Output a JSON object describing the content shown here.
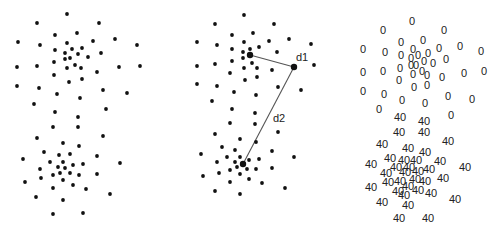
{
  "panels": [
    {
      "id": "raw-points",
      "points": [
        [
          67,
          14
        ],
        [
          37,
          23
        ],
        [
          99,
          23
        ],
        [
          55,
          35
        ],
        [
          77,
          33
        ],
        [
          18,
          42
        ],
        [
          40,
          45
        ],
        [
          67,
          43
        ],
        [
          93,
          41
        ],
        [
          115,
          39
        ],
        [
          137,
          45
        ],
        [
          55,
          50
        ],
        [
          65,
          53
        ],
        [
          72,
          49
        ],
        [
          82,
          48
        ],
        [
          78,
          54
        ],
        [
          70,
          58
        ],
        [
          65,
          59
        ],
        [
          88,
          57
        ],
        [
          101,
          53
        ],
        [
          54,
          62
        ],
        [
          75,
          65
        ],
        [
          17,
          67
        ],
        [
          37,
          66
        ],
        [
          67,
          68
        ],
        [
          81,
          68
        ],
        [
          97,
          72
        ],
        [
          119,
          67
        ],
        [
          140,
          66
        ],
        [
          54,
          75
        ],
        [
          82,
          79
        ],
        [
          69,
          82
        ],
        [
          17,
          86
        ],
        [
          39,
          88
        ],
        [
          57,
          94
        ],
        [
          80,
          98
        ],
        [
          103,
          90
        ],
        [
          127,
          93
        ],
        [
          34,
          104
        ],
        [
          55,
          112
        ],
        [
          106,
          109
        ],
        [
          78,
          117
        ],
        [
          53,
          127
        ],
        [
          78,
          127
        ],
        [
          37,
          138
        ],
        [
          103,
          136
        ],
        [
          63,
          143
        ],
        [
          79,
          146
        ],
        [
          44,
          152
        ],
        [
          59,
          155
        ],
        [
          70,
          154
        ],
        [
          23,
          159
        ],
        [
          97,
          156
        ],
        [
          50,
          162
        ],
        [
          63,
          162
        ],
        [
          73,
          165
        ],
        [
          83,
          164
        ],
        [
          120,
          163
        ],
        [
          58,
          167
        ],
        [
          65,
          168
        ],
        [
          40,
          169
        ],
        [
          60,
          173
        ],
        [
          70,
          173
        ],
        [
          53,
          175
        ],
        [
          79,
          175
        ],
        [
          97,
          174
        ],
        [
          63,
          180
        ],
        [
          41,
          178
        ],
        [
          25,
          182
        ],
        [
          73,
          185
        ],
        [
          53,
          188
        ],
        [
          86,
          189
        ],
        [
          110,
          194
        ],
        [
          36,
          197
        ],
        [
          63,
          200
        ],
        [
          53,
          214
        ],
        [
          83,
          213
        ]
      ]
    },
    {
      "id": "distance-illustration",
      "points": [
        [
          244,
          15
        ],
        [
          215,
          24
        ],
        [
          274,
          24
        ],
        [
          232,
          35
        ],
        [
          253,
          33
        ],
        [
          197,
          42
        ],
        [
          217,
          45
        ],
        [
          244,
          42
        ],
        [
          269,
          41
        ],
        [
          289,
          39
        ],
        [
          311,
          44
        ],
        [
          232,
          49
        ],
        [
          243,
          52
        ],
        [
          250,
          49
        ],
        [
          259,
          47
        ],
        [
          277,
          52
        ],
        [
          243,
          58
        ],
        [
          232,
          61
        ],
        [
          252,
          63
        ],
        [
          215,
          64
        ],
        [
          197,
          66
        ],
        [
          244,
          68
        ],
        [
          257,
          68
        ],
        [
          272,
          70
        ],
        [
          314,
          65
        ],
        [
          230,
          73
        ],
        [
          257,
          77
        ],
        [
          245,
          80
        ],
        [
          197,
          84
        ],
        [
          217,
          86
        ],
        [
          278,
          87
        ],
        [
          301,
          90
        ],
        [
          234,
          92
        ],
        [
          256,
          95
        ],
        [
          212,
          101
        ],
        [
          232,
          109
        ],
        [
          255,
          113
        ],
        [
          230,
          123
        ],
        [
          255,
          124
        ],
        [
          215,
          134
        ],
        [
          278,
          132
        ],
        [
          240,
          139
        ],
        [
          256,
          142
        ],
        [
          222,
          147
        ],
        [
          235,
          150
        ],
        [
          201,
          154
        ],
        [
          272,
          151
        ],
        [
          294,
          157
        ],
        [
          227,
          157
        ],
        [
          240,
          157
        ],
        [
          217,
          162
        ],
        [
          235,
          162
        ],
        [
          249,
          160
        ],
        [
          259,
          159
        ],
        [
          237,
          167
        ],
        [
          247,
          169
        ],
        [
          256,
          169
        ],
        [
          230,
          170
        ],
        [
          272,
          168
        ],
        [
          219,
          173
        ],
        [
          240,
          174
        ],
        [
          203,
          176
        ],
        [
          230,
          182
        ],
        [
          249,
          179
        ],
        [
          262,
          183
        ],
        [
          285,
          188
        ],
        [
          215,
          191
        ],
        [
          240,
          194
        ]
      ],
      "highlighted": {
        "center_top": [
          250,
          55
        ],
        "query_point": [
          294,
          67
        ],
        "center_bottom": [
          243,
          164
        ]
      },
      "edges": [
        {
          "from": [
            250,
            55
          ],
          "to": [
            294,
            67
          ],
          "label": "d1",
          "label_pos": [
            302,
            61
          ]
        },
        {
          "from": [
            294,
            67
          ],
          "to": [
            243,
            164
          ],
          "label": "d2",
          "label_pos": [
            279,
            122
          ]
        }
      ]
    },
    {
      "id": "cluster-labels",
      "labels": [
        {
          "text": "0",
          "pos": [
            412,
            21
          ]
        },
        {
          "text": "0",
          "pos": [
            383,
            30
          ]
        },
        {
          "text": "0",
          "pos": [
            444,
            30
          ]
        },
        {
          "text": "0",
          "pos": [
            401,
            42
          ]
        },
        {
          "text": "0",
          "pos": [
            423,
            40
          ]
        },
        {
          "text": "0",
          "pos": [
            363,
            49
          ]
        },
        {
          "text": "0",
          "pos": [
            385,
            52
          ]
        },
        {
          "text": "0",
          "pos": [
            413,
            49
          ]
        },
        {
          "text": "0",
          "pos": [
            439,
            48
          ]
        },
        {
          "text": "0",
          "pos": [
            460,
            46
          ]
        },
        {
          "text": "0",
          "pos": [
            481,
            51
          ]
        },
        {
          "text": "0",
          "pos": [
            401,
            55
          ]
        },
        {
          "text": "0",
          "pos": [
            411,
            58
          ]
        },
        {
          "text": "0",
          "pos": [
            418,
            55
          ]
        },
        {
          "text": "0",
          "pos": [
            428,
            53
          ]
        },
        {
          "text": "0",
          "pos": [
            446,
            59
          ]
        },
        {
          "text": "0",
          "pos": [
            424,
            61
          ]
        },
        {
          "text": "0",
          "pos": [
            433,
            63
          ]
        },
        {
          "text": "0",
          "pos": [
            411,
            65
          ]
        },
        {
          "text": "0",
          "pos": [
            416,
            65
          ]
        },
        {
          "text": "0",
          "pos": [
            400,
            68
          ]
        },
        {
          "text": "0",
          "pos": [
            363,
            72
          ]
        },
        {
          "text": "0",
          "pos": [
            383,
            71
          ]
        },
        {
          "text": "0",
          "pos": [
            413,
            74
          ]
        },
        {
          "text": "0",
          "pos": [
            422,
            71
          ]
        },
        {
          "text": "0",
          "pos": [
            427,
            75
          ]
        },
        {
          "text": "0",
          "pos": [
            442,
            77
          ]
        },
        {
          "text": "0",
          "pos": [
            464,
            73
          ]
        },
        {
          "text": "0",
          "pos": [
            484,
            71
          ]
        },
        {
          "text": "0",
          "pos": [
            399,
            80
          ]
        },
        {
          "text": "0",
          "pos": [
            414,
            87
          ]
        },
        {
          "text": "0",
          "pos": [
            427,
            85
          ]
        },
        {
          "text": "0",
          "pos": [
            363,
            91
          ]
        },
        {
          "text": "0",
          "pos": [
            384,
            94
          ]
        },
        {
          "text": "0",
          "pos": [
            402,
            100
          ]
        },
        {
          "text": "0",
          "pos": [
            425,
            103
          ]
        },
        {
          "text": "0",
          "pos": [
            448,
            96
          ]
        },
        {
          "text": "0",
          "pos": [
            472,
            99
          ]
        },
        {
          "text": "0",
          "pos": [
            379,
            109
          ]
        },
        {
          "text": "0",
          "pos": [
            451,
            115
          ]
        },
        {
          "text": "40",
          "pos": [
            400,
            117
          ]
        },
        {
          "text": "40",
          "pos": [
            424,
            121
          ]
        },
        {
          "text": "40",
          "pos": [
            399,
            132
          ]
        },
        {
          "text": "40",
          "pos": [
            424,
            132
          ]
        },
        {
          "text": "40",
          "pos": [
            382,
            144
          ]
        },
        {
          "text": "40",
          "pos": [
            448,
            141
          ]
        },
        {
          "text": "40",
          "pos": [
            408,
            148
          ]
        },
        {
          "text": "40",
          "pos": [
            425,
            152
          ]
        },
        {
          "text": "40",
          "pos": [
            390,
            158
          ]
        },
        {
          "text": "40",
          "pos": [
            404,
            160
          ]
        },
        {
          "text": "40",
          "pos": [
            416,
            160
          ]
        },
        {
          "text": "40",
          "pos": [
            440,
            161
          ]
        },
        {
          "text": "40",
          "pos": [
            371,
            164
          ]
        },
        {
          "text": "40",
          "pos": [
            396,
            167
          ]
        },
        {
          "text": "40",
          "pos": [
            409,
            167
          ]
        },
        {
          "text": "40",
          "pos": [
            418,
            171
          ]
        },
        {
          "text": "40",
          "pos": [
            429,
            169
          ]
        },
        {
          "text": "40",
          "pos": [
            465,
            167
          ]
        },
        {
          "text": "40",
          "pos": [
            386,
            173
          ]
        },
        {
          "text": "40",
          "pos": [
            405,
            172
          ]
        },
        {
          "text": "40",
          "pos": [
            388,
            182
          ]
        },
        {
          "text": "40",
          "pos": [
            400,
            181
          ]
        },
        {
          "text": "40",
          "pos": [
            415,
            179
          ]
        },
        {
          "text": "40",
          "pos": [
            425,
            181
          ]
        },
        {
          "text": "40",
          "pos": [
            443,
            178
          ]
        },
        {
          "text": "40",
          "pos": [
            371,
            187
          ]
        },
        {
          "text": "40",
          "pos": [
            408,
            186
          ]
        },
        {
          "text": "40",
          "pos": [
            418,
            190
          ]
        },
        {
          "text": "40",
          "pos": [
            398,
            191
          ]
        },
        {
          "text": "40",
          "pos": [
            404,
            195
          ]
        },
        {
          "text": "40",
          "pos": [
            431,
            193
          ]
        },
        {
          "text": "40",
          "pos": [
            382,
            202
          ]
        },
        {
          "text": "40",
          "pos": [
            408,
            205
          ]
        },
        {
          "text": "40",
          "pos": [
            455,
            199
          ]
        },
        {
          "text": "40",
          "pos": [
            399,
            218
          ]
        },
        {
          "text": "40",
          "pos": [
            428,
            218
          ]
        }
      ]
    }
  ],
  "colors": {
    "background": "#ffffff",
    "point": "#111111",
    "edge": "#555555",
    "label": "#222222"
  }
}
